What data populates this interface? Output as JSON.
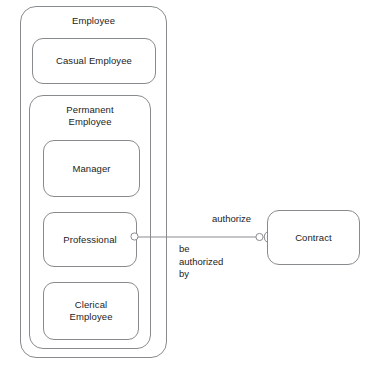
{
  "diagram": {
    "stroke_color": "#888b8d",
    "text_color": "#1c1c1c",
    "background_color": "#ffffff"
  },
  "nodes": {
    "employee": {
      "label": "Employee"
    },
    "casual_employee": {
      "label": "Casual Employee"
    },
    "permanent_employee": {
      "label": "Permanent\nEmployee"
    },
    "manager": {
      "label": "Manager"
    },
    "professional": {
      "label": "Professional"
    },
    "clerical_employee": {
      "label": "Clerical\nEmployee"
    },
    "contract": {
      "label": "Contract"
    }
  },
  "association": {
    "source": "Professional",
    "target": "Contract",
    "forward_label": "authorize",
    "reverse_label": "be\nauthorized\nby",
    "source_marker": "ball-socket-circle",
    "target_marker": "socket-arc"
  }
}
